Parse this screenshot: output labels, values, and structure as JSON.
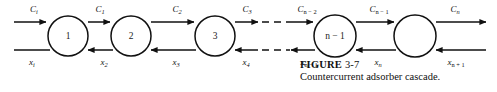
{
  "figure": {
    "caption_label": "FIGURE",
    "caption_number": "3-7",
    "caption_text": "Countercurrent adsorber cascade.",
    "line_color": "#111111",
    "background_color": "#ffffff"
  },
  "diagram": {
    "type": "process-flow-cascade",
    "top_line_y": 22,
    "bottom_line_y": 50,
    "stages": [
      {
        "id": "stage-1",
        "label": "1",
        "cx": 68,
        "cy": 36,
        "r": 20
      },
      {
        "id": "stage-2",
        "label": "2",
        "cx": 131,
        "cy": 36,
        "r": 20
      },
      {
        "id": "stage-3",
        "label": "3",
        "cx": 215,
        "cy": 36,
        "r": 20
      },
      {
        "id": "stage-n-1",
        "label": "n − 1",
        "cx": 335,
        "cy": 36,
        "r": 21
      },
      {
        "id": "stage-n",
        "label": "",
        "cx": 415,
        "cy": 36,
        "r": 21
      }
    ],
    "top_flow_labels": [
      {
        "id": "label-Ci",
        "base": "C",
        "sub": "i",
        "x": 34,
        "y": 10
      },
      {
        "id": "label-C1",
        "base": "C",
        "sub": "1",
        "x": 100,
        "y": 10
      },
      {
        "id": "label-C2",
        "base": "C",
        "sub": "2",
        "x": 177,
        "y": 10
      },
      {
        "id": "label-C3",
        "base": "C",
        "sub": "3",
        "x": 247,
        "y": 10
      },
      {
        "id": "label-Cn-2",
        "base": "C",
        "sub": "n − 2",
        "x": 305,
        "y": 10
      },
      {
        "id": "label-Cn-1",
        "base": "C",
        "sub": "n − 1",
        "x": 378,
        "y": 10
      },
      {
        "id": "label-Cn",
        "base": "C",
        "sub": "n",
        "x": 455,
        "y": 10
      }
    ],
    "bottom_flow_labels": [
      {
        "id": "label-xi",
        "base": "x",
        "sub": "i",
        "x": 32,
        "y": 65
      },
      {
        "id": "label-x2",
        "base": "x",
        "sub": "2",
        "x": 104,
        "y": 65
      },
      {
        "id": "label-x3",
        "base": "x",
        "sub": "3",
        "x": 176,
        "y": 65
      },
      {
        "id": "label-x4",
        "base": "x",
        "sub": "4",
        "x": 246,
        "y": 65
      },
      {
        "id": "label-xn-1",
        "base": "x",
        "sub": "n − 1",
        "x": 307,
        "y": 65
      },
      {
        "id": "label-xn",
        "base": "x",
        "sub": "n",
        "x": 378,
        "y": 65
      },
      {
        "id": "label-xn+1",
        "base": "x",
        "sub": "n + 1",
        "x": 455,
        "y": 65
      }
    ]
  }
}
